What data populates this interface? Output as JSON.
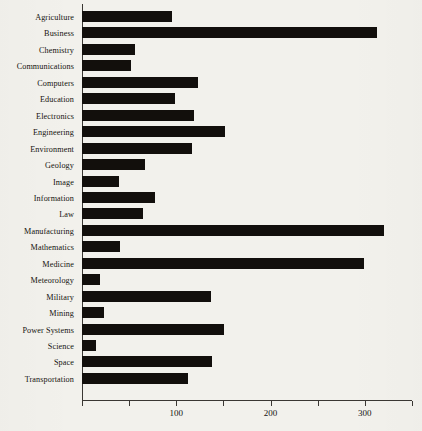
{
  "chart_data": {
    "type": "bar",
    "orientation": "horizontal",
    "title": "",
    "subtitle": "",
    "xlabel": "",
    "ylabel": "",
    "xlim": [
      0,
      350
    ],
    "ylim": null,
    "grid": false,
    "legend": null,
    "bar_color": "#120f0c",
    "background_color": "#f2f1ec",
    "axis_color": "#3a3733",
    "xticks": [
      0,
      50,
      100,
      150,
      200,
      250,
      300,
      350
    ],
    "xticklabels": [
      "",
      "",
      "100",
      "",
      "200",
      "",
      "300",
      ""
    ],
    "major_xticks": [
      100,
      200,
      300
    ],
    "categories": [
      "Agriculture",
      "Business",
      "Chemistry",
      "Communications",
      "Computers",
      "Education",
      "Electronics",
      "Engineering",
      "Environment",
      "Geology",
      "Image",
      "Information",
      "Law",
      "Manufacturing",
      "Mathematics",
      "Medicine",
      "Meteorology",
      "Military",
      "Mining",
      "Power Systems",
      "Science",
      "Space",
      "Transportation"
    ],
    "values": [
      95,
      313,
      56,
      52,
      123,
      99,
      119,
      152,
      117,
      67,
      39,
      77,
      65,
      320,
      40,
      299,
      19,
      137,
      23,
      151,
      15,
      138,
      112
    ]
  }
}
